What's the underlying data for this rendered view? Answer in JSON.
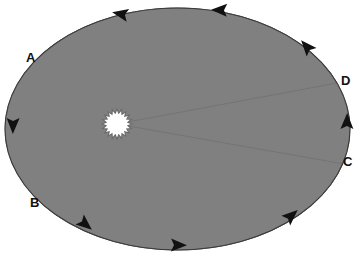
{
  "figure": {
    "type": "orbital-diagram"
  },
  "colors": {
    "background": "#ffffff",
    "orbit_stroke": "#3a3a3a",
    "sector_fill": "#808080",
    "sector_stroke": "#6f6f6f",
    "sun_fill": "#ffffff",
    "sun_stroke": "#6a6a6a",
    "arrow_fill": "#111111",
    "label_color": "#111111"
  },
  "orbit": {
    "name": "elliptical-orbit",
    "center": {
      "x": 177.5,
      "y": 129
    },
    "radius_x": 172.5,
    "radius_y": 121,
    "stroke_width": 1.1,
    "direction": "counterclockwise"
  },
  "sun": {
    "name": "sun-star",
    "center": {
      "x": 117,
      "y": 124
    },
    "outer_radius": 15,
    "inner_radius": 11,
    "points": 20
  },
  "sectors": [
    {
      "id": "sector-AB",
      "label": "swept area near perihelion (A to B)",
      "fill": "#808080",
      "start_point": {
        "x": 40,
        "y": 67
      },
      "end_point": {
        "x": 42.5,
        "y": 192
      }
    },
    {
      "id": "sector-CD",
      "label": "swept area near aphelion (C to D)",
      "fill": "#808080",
      "start_point": {
        "x": 339,
        "y": 163
      },
      "end_point": {
        "x": 337,
        "y": 83
      }
    }
  ],
  "labels": [
    {
      "id": "label-A",
      "text": "A",
      "x": 26,
      "y": 51
    },
    {
      "id": "label-B",
      "text": "B",
      "x": 30,
      "y": 196
    },
    {
      "id": "label-C",
      "text": "C",
      "x": 343,
      "y": 155
    },
    {
      "id": "label-D",
      "text": "D",
      "x": 341,
      "y": 74
    }
  ],
  "direction_arrows": [
    {
      "id": "arrow-top-left",
      "x": 121,
      "y": 14,
      "rotation": 191
    },
    {
      "id": "arrow-top-right",
      "x": 220,
      "y": 10,
      "rotation": 182
    },
    {
      "id": "arrow-upper-right",
      "x": 307,
      "y": 47,
      "rotation": 229
    },
    {
      "id": "arrow-right",
      "x": 347,
      "y": 122,
      "rotation": 271
    },
    {
      "id": "arrow-lower-right",
      "x": 291,
      "y": 216,
      "rotation": 318
    },
    {
      "id": "arrow-bottom-center",
      "x": 178,
      "y": 245,
      "rotation": 1
    },
    {
      "id": "arrow-bottom-left",
      "x": 85,
      "y": 224,
      "rotation": 40
    },
    {
      "id": "arrow-left",
      "x": 13,
      "y": 125,
      "rotation": 91
    }
  ]
}
